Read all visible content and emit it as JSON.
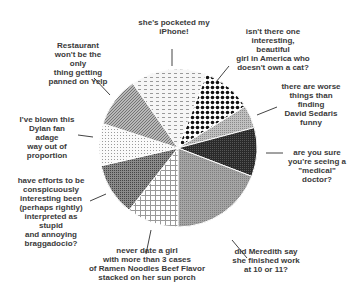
{
  "chart_data": {
    "type": "pie",
    "title": "",
    "start_angle_deg": -35,
    "direction": "clockwise",
    "center": [
      178,
      148
    ],
    "radius": 79,
    "slices": [
      {
        "label": "she's pocketed my iPhone!",
        "value": 15.6,
        "pattern": "dash-light",
        "fill": "#e4e4e4"
      },
      {
        "label": "isn't there one interesting, beautiful girl in America who doesn't own a cat?",
        "value": 10.3,
        "pattern": "diamond-dark",
        "fill": "#222222"
      },
      {
        "label": "there are worse things than finding David Sedaris funny",
        "value": 4.7,
        "pattern": "solid-gray",
        "fill": "#b4b4b4"
      },
      {
        "label": "are you sure you're seeing a \"medical\" doctor?",
        "value": 10.0,
        "pattern": "dark",
        "fill": "#2e2e2e"
      },
      {
        "label": "did Meredith say she finished work at 10 or 11?",
        "value": 19.2,
        "pattern": "medium-gray",
        "fill": "#9a9a9a"
      },
      {
        "label": "never date a girl with more than 3 cases of Ramen Noodles Beef Flavor stacked on her sun porch",
        "value": 10.6,
        "pattern": "grid",
        "fill": "#f4f4f4"
      },
      {
        "label": "have efforts to be conspicuously interesting been (perhaps rightly) interpreted as stupid and annoying braggadocio?",
        "value": 10.8,
        "pattern": "dark-gray",
        "fill": "#7a7a7a"
      },
      {
        "label": "I've blown this Dylan fan adage way out of proportion",
        "value": 8.6,
        "pattern": "dots-light",
        "fill": "#ececec"
      },
      {
        "label": "Restaurant won't be the only thing getting panned on Yelp",
        "value": 10.3,
        "pattern": "hatch-gray",
        "fill": "#a8a8a8"
      }
    ]
  },
  "labels": {
    "iphone": "she's pocketed my\niPhone!",
    "cat": "isn't there one\ninteresting, beautiful\ngirl in America who\ndoesn't own a cat?",
    "sedaris": "there are worse\nthings than\nfinding\nDavid Sedaris\nfunny",
    "medical": "are you sure\nyou're seeing a\n\"medical\"\ndoctor?",
    "meredith": "did Meredith say\nshe finished work\nat 10 or 11?",
    "ramen": "never date a girl\nwith more than 3 cases\nof Ramen Noodles Beef Flavor\nstacked on her sun porch",
    "braggadocio": "have efforts to be\nconspicuously\ninteresting been\n(perhaps rightly)\ninterpreted as stupid\nand annoying\nbraggadocio?",
    "dylan": "I've blown this\nDylan fan adage\nway out of\nproportion",
    "yelp": "Restaurant\nwon't be the only\nthing getting\npanned on Yelp"
  }
}
